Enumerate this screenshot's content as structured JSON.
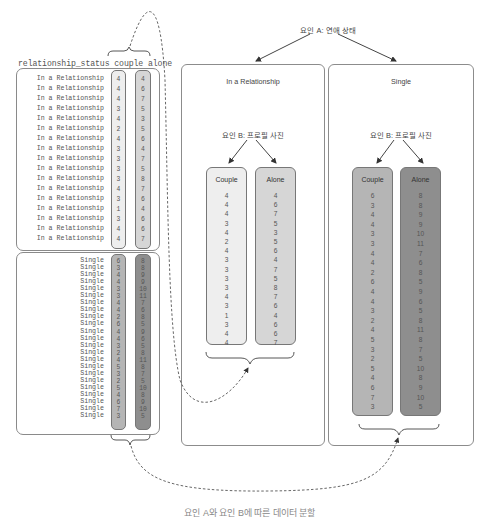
{
  "diagram": {
    "factor_a_label": "요인 A: 연애 상태",
    "factor_b_label": "요인 B: 프로필 사진",
    "caption_partial": "요인 A와 요인 B에 따른 데이터 분할",
    "table": {
      "header": "relationship_status couple alone",
      "columns": [
        "relationship_status",
        "couple",
        "alone"
      ]
    },
    "groups": [
      {
        "name": "In a Relationship",
        "couple_label": "Couple",
        "alone_label": "Alone",
        "couple": [
          4,
          4,
          4,
          3,
          4,
          2,
          4,
          3,
          3,
          3,
          3,
          4,
          3,
          1,
          3,
          4,
          4
        ],
        "alone": [
          4,
          6,
          7,
          5,
          3,
          5,
          6,
          4,
          7,
          5,
          8,
          7,
          6,
          4,
          6,
          6,
          7
        ]
      },
      {
        "name": "Single",
        "couple_label": "Couple",
        "alone_label": "Alone",
        "couple": [
          6,
          3,
          4,
          4,
          3,
          3,
          4,
          4,
          2,
          6,
          4,
          4,
          3,
          2,
          4,
          5,
          3,
          2,
          5,
          4,
          6,
          7,
          3
        ],
        "alone": [
          8,
          8,
          9,
          9,
          10,
          11,
          7,
          6,
          8,
          5,
          9,
          6,
          5,
          8,
          11,
          8,
          7,
          5,
          10,
          8,
          9,
          10,
          5
        ]
      }
    ],
    "colors": {
      "rel_couple": "#eeeeee",
      "rel_alone": "#d6d6d6",
      "single_couple": "#b5b5b5",
      "single_alone": "#8e8e8e",
      "border": "#8a8a8a",
      "arrow": "#444444"
    }
  }
}
